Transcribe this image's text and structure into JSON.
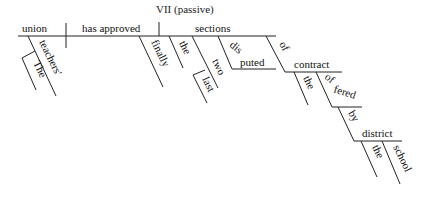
{
  "title": "VII (passive)",
  "sentence": "The teachers' union has finally approved the last two disputed sections of the contract offered by the school district.",
  "diagram": {
    "subject": "union",
    "verb": "has approved",
    "object": "sections",
    "subject_modifiers": [
      "teachers'",
      "The"
    ],
    "verb_modifiers": [
      "finally"
    ],
    "object_modifiers": [
      "the",
      "two",
      "last",
      "disputed"
    ],
    "prep_phrase": {
      "preposition": "of",
      "object": "contract",
      "modifiers": [
        "the",
        "offered"
      ],
      "participle_phrase": {
        "preposition": "by",
        "object": "district",
        "modifiers": [
          "the",
          "school"
        ]
      }
    }
  }
}
